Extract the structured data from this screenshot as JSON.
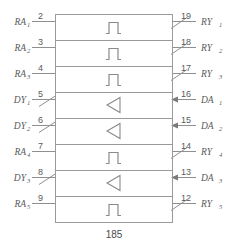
{
  "diagram": {
    "part_number": "185",
    "box": {
      "left": 55,
      "top": 14,
      "right": 172,
      "bottom": 222,
      "rows": 8
    },
    "colors": {
      "line": "#9a9a9a",
      "lead": "#8f8f8f",
      "text": "#5a5a5a",
      "glyph": "#8a8a8a",
      "background": "#ffffff"
    },
    "rows": [
      {
        "index": 0,
        "symbol": "pulse-glyph",
        "left_pin": {
          "name": "RA",
          "subscript": "1",
          "number": "2",
          "style": "plain",
          "direction": "input"
        },
        "right_pin": {
          "name": "RY",
          "subscript": "1",
          "number": "19",
          "style": "slash",
          "direction": "output"
        }
      },
      {
        "index": 1,
        "symbol": "pulse-glyph",
        "left_pin": {
          "name": "RA",
          "subscript": "2",
          "number": "3",
          "style": "plain",
          "direction": "input"
        },
        "right_pin": {
          "name": "RY",
          "subscript": "2",
          "number": "18",
          "style": "slash",
          "direction": "output"
        }
      },
      {
        "index": 2,
        "symbol": "pulse-glyph",
        "left_pin": {
          "name": "RA",
          "subscript": "3",
          "number": "4",
          "style": "plain",
          "direction": "input"
        },
        "right_pin": {
          "name": "RY",
          "subscript": "3",
          "number": "17",
          "style": "slash",
          "direction": "output"
        }
      },
      {
        "index": 3,
        "symbol": "triangle-glyph",
        "left_pin": {
          "name": "DY",
          "subscript": "1",
          "number": "5",
          "style": "slash",
          "direction": "output"
        },
        "right_pin": {
          "name": "DA",
          "subscript": "1",
          "number": "16",
          "style": "arrow",
          "direction": "input"
        }
      },
      {
        "index": 4,
        "symbol": "triangle-glyph",
        "left_pin": {
          "name": "DY",
          "subscript": "2",
          "number": "6",
          "style": "slash",
          "direction": "output"
        },
        "right_pin": {
          "name": "DA",
          "subscript": "2",
          "number": "15",
          "style": "arrow",
          "direction": "input"
        }
      },
      {
        "index": 5,
        "symbol": "pulse-glyph",
        "left_pin": {
          "name": "RA",
          "subscript": "4",
          "number": "7",
          "style": "plain",
          "direction": "input"
        },
        "right_pin": {
          "name": "RY",
          "subscript": "4",
          "number": "14",
          "style": "slash",
          "direction": "output"
        }
      },
      {
        "index": 6,
        "symbol": "triangle-glyph",
        "left_pin": {
          "name": "DY",
          "subscript": "3",
          "number": "8",
          "style": "slash",
          "direction": "output"
        },
        "right_pin": {
          "name": "DA",
          "subscript": "3",
          "number": "13",
          "style": "arrow",
          "direction": "input"
        }
      },
      {
        "index": 7,
        "symbol": "pulse-glyph",
        "left_pin": {
          "name": "RA",
          "subscript": "5",
          "number": "9",
          "style": "plain",
          "direction": "input"
        },
        "right_pin": {
          "name": "RY",
          "subscript": "5",
          "number": "12",
          "style": "slash",
          "direction": "output"
        }
      }
    ]
  }
}
